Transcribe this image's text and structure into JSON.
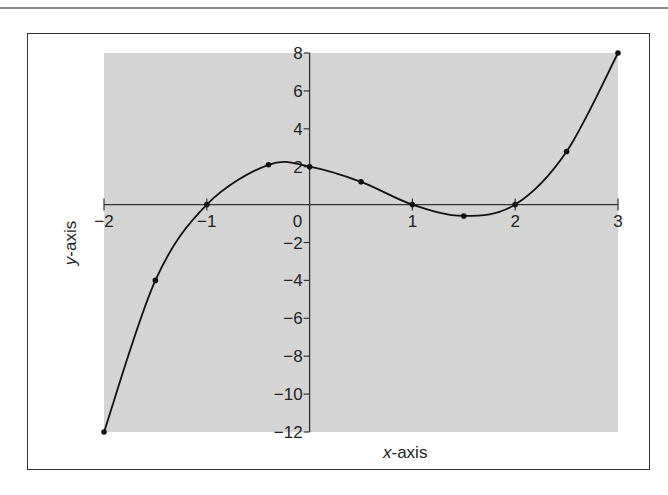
{
  "chart_data": {
    "type": "line",
    "title": "",
    "xlabel": "x-axis",
    "ylabel": "y-axis",
    "xlim": [
      -2,
      3
    ],
    "ylim": [
      -12,
      8
    ],
    "x_ticks": [
      -2,
      -1,
      0,
      1,
      2,
      3
    ],
    "y_ticks": [
      -12,
      -10,
      -8,
      -6,
      -4,
      -2,
      2,
      4,
      6,
      8
    ],
    "origin_label": "0",
    "grid": false,
    "plot_background": "#d4d4d4",
    "line_color": "#111111",
    "series": [
      {
        "name": "f(x)",
        "points": [
          {
            "x": -2,
            "y": -12
          },
          {
            "x": -1.5,
            "y": -4
          },
          {
            "x": -1,
            "y": 0
          },
          {
            "x": -0.4,
            "y": 2.1
          },
          {
            "x": 0,
            "y": 2
          },
          {
            "x": 0.5,
            "y": 1.2
          },
          {
            "x": 1,
            "y": 0
          },
          {
            "x": 1.5,
            "y": -0.6
          },
          {
            "x": 2,
            "y": 0
          },
          {
            "x": 2.5,
            "y": 2.8
          },
          {
            "x": 3,
            "y": 8
          }
        ]
      }
    ]
  }
}
